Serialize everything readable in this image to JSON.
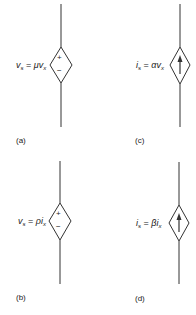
{
  "panels": [
    {
      "id": "a",
      "caption": "(a)",
      "type": "voltage-controlled voltage source",
      "equation": {
        "lhs": "v",
        "lhs_sub": "s",
        "eq": " = ",
        "coef": "μ",
        "var": "v",
        "var_sub": "x"
      },
      "symbol": "diamond-plus-minus"
    },
    {
      "id": "b",
      "caption": "(b)",
      "type": "current-controlled voltage source",
      "equation": {
        "lhs": "v",
        "lhs_sub": "s",
        "eq": " = ",
        "coef": "ρ",
        "var": "i",
        "var_sub": "x"
      },
      "symbol": "diamond-plus-minus"
    },
    {
      "id": "c",
      "caption": "(c)",
      "type": "voltage-controlled current source",
      "equation": {
        "lhs": "i",
        "lhs_sub": "s",
        "eq": " = ",
        "coef": "α",
        "var": "v",
        "var_sub": "x"
      },
      "symbol": "diamond-arrow-up"
    },
    {
      "id": "d",
      "caption": "(d)",
      "type": "current-controlled current source",
      "equation": {
        "lhs": "i",
        "lhs_sub": "s",
        "eq": " = ",
        "coef": "β",
        "var": "i",
        "var_sub": "x"
      },
      "symbol": "diamond-arrow-up"
    }
  ],
  "symbols": {
    "plus": "+",
    "minus": "−"
  },
  "colors": {
    "line": "#333333",
    "background": "#ffffff"
  }
}
